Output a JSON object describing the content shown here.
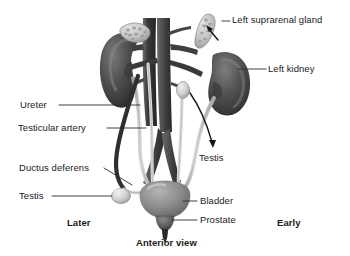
{
  "figure": {
    "title_caption": "Anterior view",
    "side_markers": {
      "left": "Later",
      "right": "Early"
    },
    "labels": [
      {
        "id": "left-suprarenal-gland",
        "text": "Left suprarenal gland"
      },
      {
        "id": "left-kidney",
        "text": "Left kidney"
      },
      {
        "id": "ureter",
        "text": "Ureter"
      },
      {
        "id": "testicular-artery",
        "text": "Testicular artery"
      },
      {
        "id": "ductus-deferens",
        "text": "Ductus deferens"
      },
      {
        "id": "testis-left",
        "text": "Testis"
      },
      {
        "id": "testis-right",
        "text": "Testis"
      },
      {
        "id": "bladder",
        "text": "Bladder"
      },
      {
        "id": "prostate",
        "text": "Prostate"
      }
    ],
    "colors": {
      "background": "#ffffff",
      "text": "#1b1b1b",
      "leader_line": "#2b2b2b",
      "kidney_dark": "#4a4a4a",
      "kidney_shadow": "#2e2e2e",
      "kidney_highlight": "#6e6e6e",
      "suprarenal_gland": "#c9c9c9",
      "vessel_dark": "#3a3a3a",
      "vessel_mid": "#585858",
      "ureter_light": "#d8d8d8",
      "bladder_gray": "#8e8e8e",
      "testis_light": "#d5d5d5",
      "ductus_dark": "#333333"
    }
  }
}
